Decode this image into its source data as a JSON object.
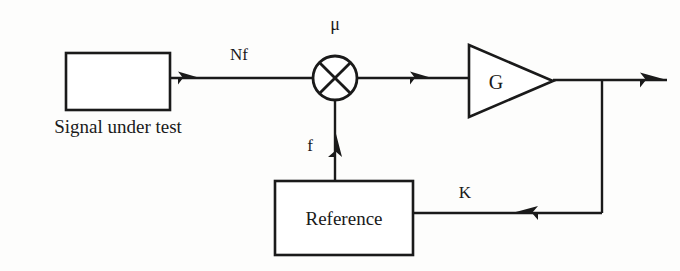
{
  "diagram": {
    "background_color": "#fdfdfc",
    "line_color": "#1a1a1a",
    "blocks": {
      "source": {
        "label": "",
        "caption": "Signal under test",
        "shape": "rectangle"
      },
      "mixer": {
        "label": "",
        "symbol": "multiplier-cross",
        "top_label": "μ",
        "shape": "circle-with-x"
      },
      "amplifier": {
        "label": "G",
        "shape": "triangle"
      },
      "reference": {
        "label": "Reference",
        "shape": "rectangle"
      }
    },
    "signals": {
      "input_label": "Nf",
      "mixer_top_label": "μ",
      "reference_out_label": "f",
      "feedback_label": "K"
    }
  }
}
